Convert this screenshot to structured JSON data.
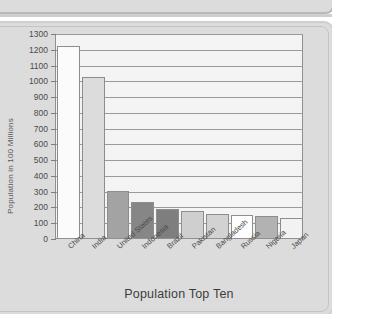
{
  "chart_data": {
    "type": "bar",
    "title": "",
    "xlabel": "Population Top Ten",
    "ylabel": "Population in 100 Millions",
    "categories": [
      "China",
      "India",
      "United States",
      "Indonesia",
      "Brazil",
      "Pakistan",
      "Bangladesh",
      "Russia",
      "Nigeria",
      "Japan"
    ],
    "values": [
      1220,
      1020,
      300,
      230,
      185,
      170,
      152,
      145,
      138,
      130
    ],
    "ylim": [
      0,
      1300
    ],
    "ytick_labels": [
      "1300",
      "1200",
      "1100",
      "1000",
      "900",
      "800",
      "700",
      "600",
      "500",
      "400",
      "300",
      "200",
      "100",
      "0"
    ],
    "yticks": [
      1300,
      1200,
      1100,
      1000,
      900,
      800,
      700,
      600,
      500,
      400,
      300,
      200,
      100,
      0
    ],
    "ytick_step": 100,
    "grid": "horizontal",
    "legend": "none",
    "bar_colors": [
      "#fbfbfb",
      "#dcdcdc",
      "#a3a3a3",
      "#868686",
      "#7e7e7e",
      "#cfcfcf",
      "#d2d2d2",
      "#fdfdfd",
      "#b2b2b2",
      "#f2f2f2"
    ],
    "series": [
      {
        "name": "Population",
        "values": [
          1220,
          1020,
          300,
          230,
          185,
          170,
          152,
          145,
          138,
          130
        ]
      }
    ]
  },
  "plot": {
    "background_color": "#f4f4f4",
    "axis_color": "#909090",
    "gridline_color": "#9a9a9a"
  },
  "frame": {
    "panel_color": "#dcdcdc",
    "border_color": "#c4c4c4"
  }
}
